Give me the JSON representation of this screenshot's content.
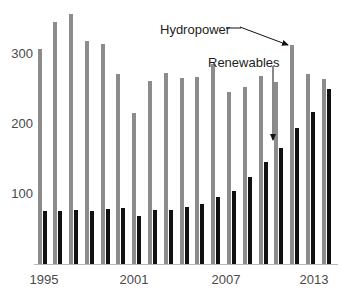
{
  "chart_data": {
    "type": "bar",
    "title": "",
    "subtitle": "",
    "xlabel": "",
    "ylabel": "",
    "categories": [
      1995,
      1996,
      1997,
      1998,
      1999,
      2000,
      2001,
      2002,
      2003,
      2004,
      2005,
      2006,
      2007,
      2008,
      2009,
      2010,
      2011,
      2012,
      2013
    ],
    "x_tick_labels": [
      "1995",
      "2001",
      "2007",
      "2013"
    ],
    "x_tick_values": [
      1995,
      2001,
      2007,
      2013
    ],
    "y_tick_labels": [
      "100",
      "200",
      "300"
    ],
    "y_tick_values": [
      100,
      200,
      300
    ],
    "ylim": [
      0,
      375
    ],
    "grid": false,
    "legend_position": "none",
    "series": [
      {
        "name": "Hydropower",
        "color": "#8c8c8c",
        "values": [
          310,
          349,
          361,
          322,
          317,
          274,
          218,
          264,
          275,
          268,
          270,
          288,
          248,
          256,
          271,
          262,
          316,
          274,
          267
        ]
      },
      {
        "name": "Renewables",
        "color": "#111111",
        "values": [
          76,
          77,
          78,
          77,
          79,
          81,
          70,
          78,
          78,
          82,
          87,
          96,
          105,
          126,
          147,
          168,
          196,
          219,
          252
        ]
      }
    ],
    "annotations": [
      {
        "text": "Hydropower",
        "target_series": "Hydropower",
        "target_category": 2011,
        "arrow": true
      },
      {
        "text": "Renewables",
        "target_series": "Renewables",
        "target_category": 2010,
        "arrow": true
      }
    ]
  }
}
